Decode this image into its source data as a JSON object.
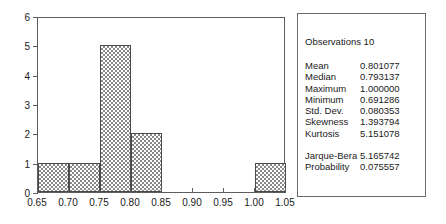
{
  "chart_data": {
    "type": "bar",
    "title": "",
    "subtitle": "",
    "xlabel": "",
    "ylabel": "",
    "grid": false,
    "legend": "none",
    "xlim": [
      0.65,
      1.05
    ],
    "ylim": [
      0,
      6
    ],
    "x_ticks": [
      "0.65",
      "0.70",
      "0.75",
      "0.80",
      "0.85",
      "0.90",
      "0.95",
      "1.00",
      "1.05"
    ],
    "x_tick_values": [
      0.65,
      0.7,
      0.75,
      0.8,
      0.85,
      0.9,
      0.95,
      1.0,
      1.05
    ],
    "y_ticks": [
      "0",
      "1",
      "2",
      "3",
      "4",
      "5",
      "6"
    ],
    "y_tick_values": [
      0,
      1,
      2,
      3,
      4,
      5,
      6
    ],
    "bin_width": 0.05,
    "bin_edges": [
      0.65,
      0.7,
      0.75,
      0.8,
      0.85,
      0.9,
      0.95,
      1.0,
      1.05
    ],
    "categories": [
      "0.65-0.70",
      "0.70-0.75",
      "0.75-0.80",
      "0.80-0.85",
      "0.85-0.90",
      "0.90-0.95",
      "0.95-1.00",
      "1.00-1.05"
    ],
    "values": [
      1,
      1,
      5,
      2,
      0,
      0,
      0,
      1
    ],
    "bars": [
      {
        "x0": 0.65,
        "x1": 0.7,
        "count": 1
      },
      {
        "x0": 0.7,
        "x1": 0.75,
        "count": 1
      },
      {
        "x0": 0.75,
        "x1": 0.8,
        "count": 5
      },
      {
        "x0": 0.8,
        "x1": 0.85,
        "count": 2
      },
      {
        "x0": 1.0,
        "x1": 1.05,
        "count": 1
      }
    ],
    "bar_fill": "crosshatch",
    "bar_color": "#8a8a8a",
    "axis_color": "#5d5d5d"
  },
  "stats": {
    "observations_label": "Observations 10",
    "observations_name": "Observations",
    "observations_value": "10",
    "rows": [
      {
        "label": "Mean",
        "value": "0.801077"
      },
      {
        "label": "Median",
        "value": "0.793137"
      },
      {
        "label": "Maximum",
        "value": "1.000000"
      },
      {
        "label": "Minimum",
        "value": "0.691286"
      },
      {
        "label": "Std. Dev.",
        "value": "0.080353"
      },
      {
        "label": "Skewness",
        "value": "1.393794"
      },
      {
        "label": "Kurtosis",
        "value": "5.151078"
      }
    ],
    "tests": [
      {
        "label": "Jarque-Bera",
        "value": "5.165742"
      },
      {
        "label": "Probability",
        "value": "0.075557"
      }
    ]
  }
}
